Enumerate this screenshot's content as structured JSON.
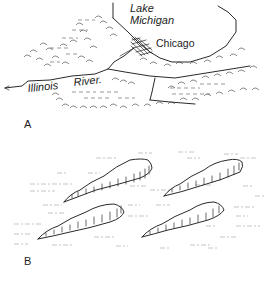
{
  "figure": {
    "panels": [
      {
        "id": "A",
        "label": "A",
        "labels": {
          "lake_line1": "Lake",
          "lake_line2": "Michigan",
          "city": "Chicago",
          "river_word1": "Illinois",
          "river_word2": "River."
        }
      },
      {
        "id": "B",
        "label": "B"
      }
    ],
    "colors": {
      "ink": "#2a2a2a",
      "background": "#ffffff"
    }
  }
}
